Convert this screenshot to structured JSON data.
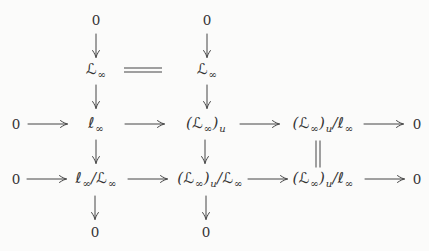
{
  "figure": {
    "type": "commutative-diagram",
    "ink_color": "#333333",
    "background_color": "#fbfbfa"
  },
  "nodes": {
    "top_zero_left": "0",
    "top_zero_right": "0",
    "L_inf_left": "ℒ_{∞}",
    "L_inf_right": "ℒ_{∞}",
    "row3_zero_left": "0",
    "row3_l_inf": "ℓ_{∞}",
    "row3_L_inf_u": "(ℒ_{∞})_{u}",
    "row3_L_inf_u_mod_l_inf": "(ℒ_{∞})_{u}/ℓ_{∞}",
    "row3_zero_right": "0",
    "row4_zero_left": "0",
    "row4_l_inf_mod_L_inf": "ℓ_{∞}/ℒ_{∞}",
    "row4_L_inf_u_mod_L_inf": "(ℒ_{∞})_{u}/ℒ_{∞}",
    "row4_L_inf_u_mod_l_inf": "(ℒ_{∞})_{u}/ℓ_{∞}",
    "row4_zero_right": "0",
    "bottom_zero_left": "0",
    "bottom_zero_right": "0"
  },
  "icons": {
    "right-arrow": "⟶",
    "down-arrow": "↓",
    "double-equals": "=",
    "vertical-double-equals": "‖"
  }
}
